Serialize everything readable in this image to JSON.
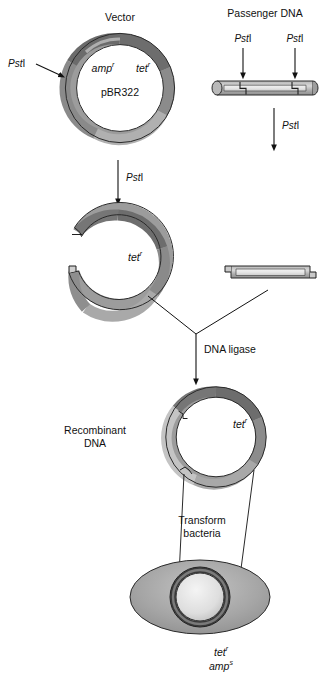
{
  "figure": {
    "title_vector": "Vector",
    "title_passenger": "Passenger DNA",
    "plasmid_name": "pBR322",
    "gene_amp": "amp",
    "gene_amp_sup": "r",
    "gene_tet": "tet",
    "gene_tet_sup": "r",
    "enzyme_italic": "Pst",
    "enzyme_roman": "I",
    "ligase_label": "DNA ligase",
    "recombinant_label_line1": "Recombinant",
    "recombinant_label_line2": "DNA",
    "transform_label_line1": "Transform",
    "transform_label_line2": "bacteria",
    "result_tet": "tet",
    "result_tet_sup": "r",
    "result_amp": "amp",
    "result_amp_sup": "s"
  },
  "labels": {
    "pstI_vector_left": "PstI",
    "pstI_passenger_left": "PstI",
    "pstI_passenger_right": "PstI",
    "pstI_digest_vector": "PstI",
    "pstI_digest_passenger": "PstI"
  },
  "colors": {
    "ring_dark": "#6f6f6f",
    "ring_mid": "#9a9a9a",
    "ring_light": "#c9c9c9",
    "dna_shell": "#a8a8a8",
    "dna_core": "#e2e2e2",
    "cell_fill": "#a6a6a6",
    "outline": "#1a1a1a",
    "text": "#111111",
    "background": "#ffffff"
  },
  "steps": [
    {
      "name": "vector-plasmid",
      "caption": "Vector"
    },
    {
      "name": "passenger-dna",
      "caption": "Passenger DNA"
    },
    {
      "name": "digest-with-pstI",
      "caption": "PstI"
    },
    {
      "name": "linearized-vector",
      "caption": "tet"
    },
    {
      "name": "excised-fragment",
      "caption": ""
    },
    {
      "name": "ligation",
      "caption": "DNA ligase"
    },
    {
      "name": "recombinant-plasmid",
      "caption": "Recombinant DNA"
    },
    {
      "name": "transformation",
      "caption": "Transform bacteria"
    },
    {
      "name": "transformed-bacterium",
      "caption": "tet r amp s"
    }
  ]
}
